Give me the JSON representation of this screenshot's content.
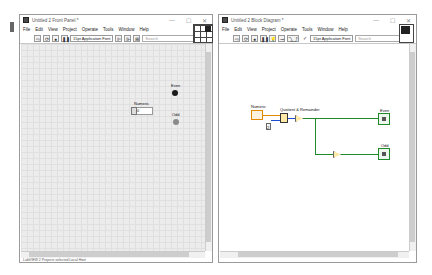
{
  "front_panel": {
    "title": "Untitled 2 Front Panel *",
    "menu": [
      "File",
      "Edit",
      "View",
      "Project",
      "Operate",
      "Tools",
      "Window",
      "Help"
    ],
    "toolbar": {
      "font": "15pt Application Font",
      "search_placeholder": "Search",
      "help": "?"
    },
    "controls": {
      "numeric_label": "Numeric",
      "numeric_value": "0",
      "even_label": "Even",
      "odd_label": "Odd"
    },
    "status": "LabVIEW    2 Projects selected    Local Host"
  },
  "block_diagram": {
    "title": "Untitled 2 Block Diagram *",
    "menu": [
      "File",
      "Edit",
      "View",
      "Project",
      "Operate",
      "Tools",
      "Window",
      "Help"
    ],
    "toolbar": {
      "font": "15pt Application Font",
      "search_placeholder": "Search",
      "help": "?"
    },
    "nodes": {
      "numeric_label": "Numeric",
      "quotient_label": "Quotient & Remainder",
      "constant_value": "2",
      "even_label": "Even",
      "odd_label": "Odd"
    }
  },
  "window_controls": {
    "minimize": "—",
    "maximize": "☐",
    "close": "✕"
  },
  "colors": {
    "fp_canvas": "#ececec",
    "led_on": "#1a1a1a",
    "led_off": "#8a8a8a"
  }
}
